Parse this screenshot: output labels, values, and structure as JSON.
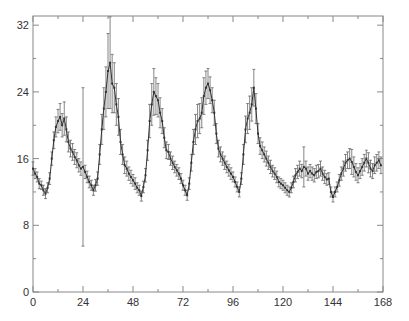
{
  "chart_data": {
    "type": "line",
    "title": "",
    "xlabel": "",
    "ylabel": "",
    "xlim": [
      0,
      168
    ],
    "ylim": [
      0,
      33
    ],
    "grid": false,
    "legend": null,
    "x_ticks": [
      0,
      24,
      48,
      72,
      96,
      120,
      144,
      168
    ],
    "x_minor_ticks": [
      12,
      36,
      60,
      84,
      108,
      132,
      156
    ],
    "y_ticks": [
      0,
      8,
      16,
      24,
      32
    ],
    "y_minor_ticks": [
      4,
      12,
      20,
      28
    ],
    "series": [
      {
        "name": "series-1",
        "style": "line with error bars",
        "color": "#333333",
        "x": [
          0,
          1,
          2,
          3,
          4,
          5,
          6,
          7,
          8,
          9,
          10,
          11,
          12,
          13,
          14,
          15,
          16,
          17,
          18,
          19,
          20,
          21,
          22,
          23,
          24,
          25,
          26,
          27,
          28,
          29,
          30,
          31,
          32,
          33,
          34,
          35,
          36,
          37,
          38,
          39,
          40,
          41,
          42,
          43,
          44,
          45,
          46,
          47,
          48,
          49,
          50,
          51,
          52,
          53,
          54,
          55,
          56,
          57,
          58,
          59,
          60,
          61,
          62,
          63,
          64,
          65,
          66,
          67,
          68,
          69,
          70,
          71,
          72,
          73,
          74,
          75,
          76,
          77,
          78,
          79,
          80,
          81,
          82,
          83,
          84,
          85,
          86,
          87,
          88,
          89,
          90,
          91,
          92,
          93,
          94,
          95,
          96,
          97,
          98,
          99,
          100,
          101,
          102,
          103,
          104,
          105,
          106,
          107,
          108,
          109,
          110,
          111,
          112,
          113,
          114,
          115,
          116,
          117,
          118,
          119,
          120,
          121,
          122,
          123,
          124,
          125,
          126,
          127,
          128,
          129,
          130,
          131,
          132,
          133,
          134,
          135,
          136,
          137,
          138,
          139,
          140,
          141,
          142,
          143,
          144,
          145,
          146,
          147,
          148,
          149,
          150,
          151,
          152,
          153,
          154,
          155,
          156,
          157,
          158,
          159,
          160,
          161,
          162,
          163,
          164,
          165,
          166,
          167
        ],
        "y": [
          14.8,
          14.2,
          13.8,
          13.0,
          12.8,
          12.2,
          11.8,
          12.5,
          13.6,
          16.0,
          18.2,
          19.8,
          20.5,
          21.0,
          20.0,
          20.8,
          19.5,
          18.0,
          17.2,
          16.8,
          16.2,
          15.8,
          15.2,
          14.8,
          15.0,
          14.4,
          13.8,
          13.2,
          12.8,
          12.2,
          12.8,
          13.6,
          16.5,
          19.5,
          22.0,
          24.0,
          26.5,
          27.5,
          25.0,
          24.5,
          22.5,
          21.0,
          18.0,
          16.5,
          15.2,
          14.8,
          14.2,
          13.8,
          13.4,
          13.0,
          12.5,
          12.2,
          11.5,
          12.6,
          14.0,
          17.0,
          20.5,
          22.5,
          24.0,
          23.5,
          23.0,
          21.5,
          20.5,
          18.5,
          17.0,
          16.8,
          16.0,
          15.5,
          15.0,
          14.6,
          14.2,
          13.6,
          12.8,
          12.2,
          11.6,
          13.0,
          15.5,
          18.0,
          19.5,
          20.5,
          20.8,
          21.5,
          23.5,
          24.5,
          25.0,
          24.2,
          23.0,
          21.5,
          19.0,
          17.2,
          16.5,
          16.0,
          15.5,
          15.0,
          14.6,
          14.2,
          13.8,
          13.2,
          12.6,
          12.0,
          13.6,
          16.5,
          19.5,
          20.8,
          21.5,
          22.5,
          24.5,
          22.0,
          19.0,
          17.5,
          17.0,
          16.5,
          16.0,
          15.5,
          15.0,
          14.5,
          14.2,
          13.8,
          13.2,
          13.0,
          12.8,
          12.5,
          12.2,
          12.0,
          12.5,
          13.2,
          14.0,
          14.4,
          14.8,
          14.5,
          15.0,
          14.8,
          14.2,
          14.5,
          14.2,
          14.0,
          14.4,
          14.5,
          14.8,
          14.2,
          13.8,
          13.5,
          13.6,
          12.0,
          11.4,
          12.0,
          12.6,
          13.4,
          14.2,
          14.8,
          15.5,
          15.8,
          16.0,
          15.6,
          15.0,
          14.4,
          14.0,
          14.5,
          15.0,
          15.5,
          16.0,
          15.5,
          14.8,
          14.5,
          15.2,
          15.5,
          15.8,
          15.2
        ],
        "error": [
          0.8,
          0.6,
          0.6,
          0.6,
          0.5,
          0.6,
          0.6,
          0.6,
          0.7,
          0.8,
          1.0,
          1.2,
          1.4,
          1.6,
          1.4,
          2.0,
          1.5,
          1.2,
          1.0,
          1.0,
          0.9,
          0.9,
          0.8,
          0.8,
          9.5,
          0.8,
          0.7,
          0.7,
          0.6,
          0.6,
          0.7,
          0.8,
          1.2,
          1.8,
          2.5,
          3.0,
          4.5,
          5.5,
          3.5,
          3.0,
          2.5,
          2.2,
          1.5,
          1.2,
          1.0,
          0.9,
          0.8,
          0.8,
          0.7,
          0.7,
          0.6,
          0.6,
          0.6,
          0.7,
          0.8,
          1.2,
          2.0,
          2.5,
          2.8,
          2.2,
          2.0,
          1.8,
          1.5,
          1.2,
          1.0,
          0.9,
          0.8,
          0.8,
          0.7,
          0.7,
          0.7,
          0.6,
          0.6,
          0.6,
          0.6,
          0.7,
          1.0,
          1.5,
          1.8,
          2.0,
          1.8,
          1.8,
          2.2,
          2.0,
          1.8,
          1.6,
          1.5,
          1.5,
          1.2,
          1.0,
          0.9,
          0.8,
          0.8,
          0.7,
          0.7,
          0.7,
          0.6,
          0.6,
          0.6,
          0.6,
          0.7,
          1.2,
          1.6,
          1.8,
          2.0,
          2.0,
          2.2,
          1.8,
          1.2,
          1.0,
          1.0,
          0.9,
          0.9,
          0.8,
          0.8,
          0.7,
          0.7,
          0.7,
          0.6,
          0.6,
          0.6,
          0.6,
          0.6,
          0.6,
          0.6,
          0.7,
          0.8,
          0.8,
          0.9,
          0.8,
          2.4,
          0.9,
          0.8,
          0.8,
          0.8,
          0.8,
          0.8,
          0.8,
          0.9,
          0.8,
          0.8,
          0.7,
          0.7,
          0.6,
          0.6,
          0.6,
          0.6,
          0.7,
          0.8,
          0.9,
          1.0,
          1.0,
          1.2,
          1.5,
          1.2,
          1.0,
          0.9,
          0.9,
          1.0,
          1.0,
          1.0,
          1.2,
          1.0,
          0.9,
          1.0,
          1.0,
          1.0,
          1.0
        ]
      }
    ]
  },
  "axes": {
    "x_tick_labels": [
      "0",
      "24",
      "48",
      "72",
      "96",
      "120",
      "144",
      "168"
    ],
    "y_tick_labels": [
      "0",
      "8",
      "16",
      "24",
      "32"
    ]
  }
}
